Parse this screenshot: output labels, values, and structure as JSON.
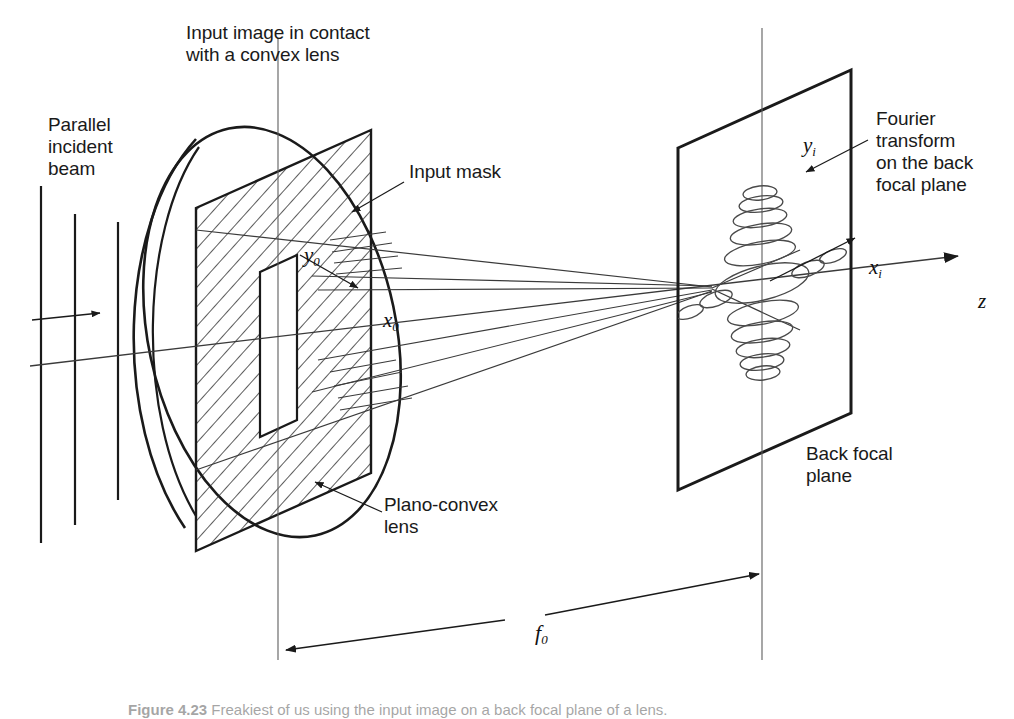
{
  "figure": {
    "background": "#ffffff",
    "ink": "#1a1a1a"
  },
  "labels": {
    "input_image": "Input image in contact\nwith a convex lens",
    "parallel_beam": "Parallel\nincident\nbeam",
    "input_mask": "Input mask",
    "plano_convex": "Plano-convex\nlens",
    "fourier_transform": "Fourier\ntransform\non the back\nfocal plane",
    "back_focal_plane": "Back focal\nplane"
  },
  "axes": {
    "y0": "y",
    "y0_sub": "0",
    "x0": "x",
    "x0_sub": "0",
    "yi": "y",
    "yi_sub": "i",
    "xi": "x",
    "xi_sub": "i",
    "z": "z",
    "f0": "f",
    "f0_sub": "0"
  },
  "caption": {
    "number": "Figure 4.23",
    "text": "  Freakiest of us using the input image on a back focal plane of a lens."
  },
  "geometry": {
    "object_plane_x": 278,
    "focal_plane_x": 762,
    "optical_axis_y": 286,
    "lens_center": {
      "x": 270,
      "y": 330
    },
    "focal_plane_corners": "678,148 851,70 851,413 678,490",
    "mask_corners": "196,208 371,130 371,473 196,551"
  },
  "colors": {
    "stroke": "#1a1a1a",
    "hatch": "#2a2a2a",
    "thin": "#3a3a3a"
  }
}
